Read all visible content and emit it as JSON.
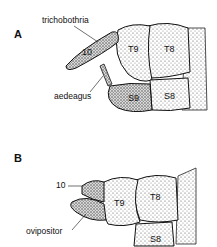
{
  "figure": {
    "panels": [
      {
        "letter": "A",
        "callouts": {
          "top": "trichobothria",
          "bottom": "aedeagus"
        },
        "segments": {
          "tergite10": "10",
          "t9": "T9",
          "t8": "T8",
          "s9": "S9",
          "s8": "S8"
        }
      },
      {
        "letter": "B",
        "callouts": {
          "top": "10",
          "bottom": "ovipositor"
        },
        "segments": {
          "t9": "T9",
          "t8": "T8",
          "s8": "S8"
        }
      }
    ],
    "colors": {
      "ink": "#111111",
      "stipple": "#6a6a6a",
      "background": "#ffffff"
    }
  }
}
